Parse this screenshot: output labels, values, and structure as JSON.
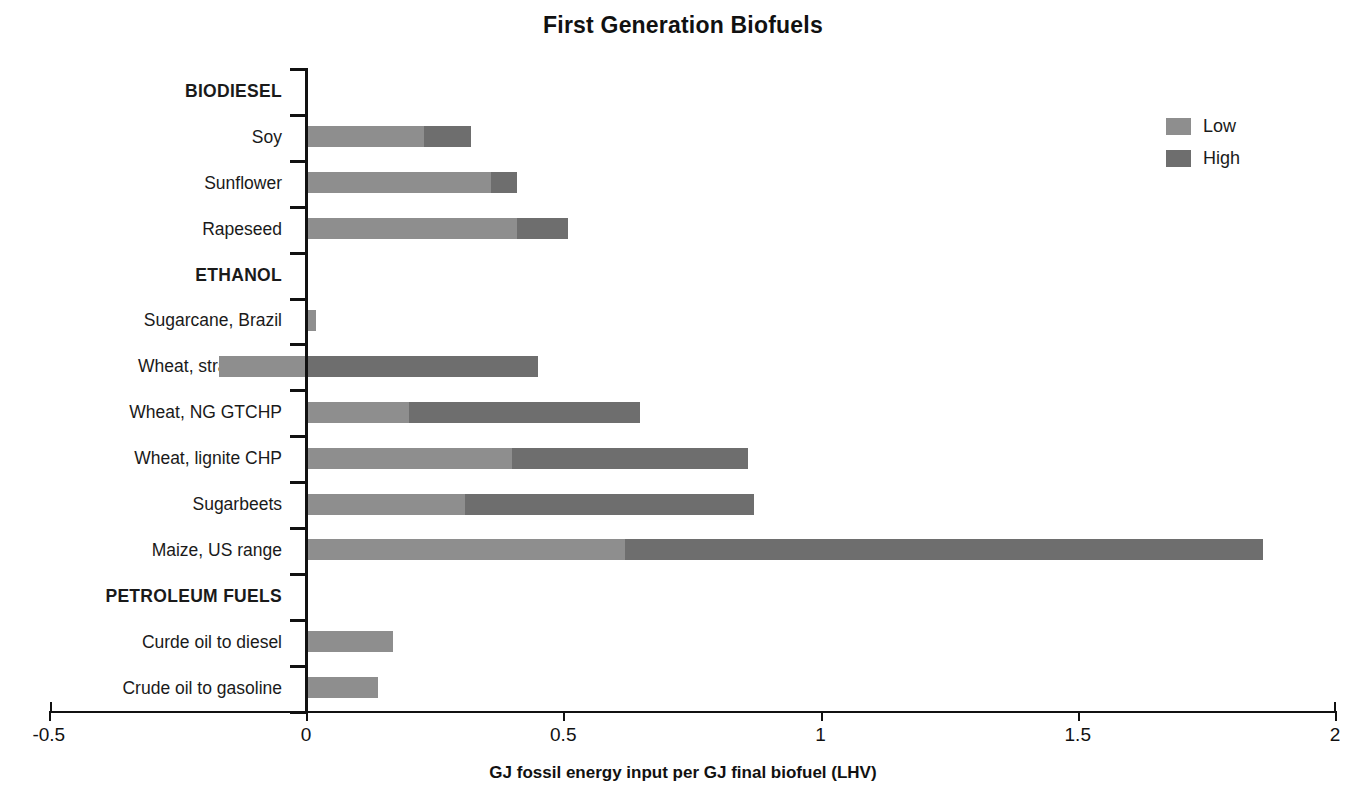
{
  "chart_data": {
    "type": "bar",
    "orientation": "horizontal",
    "stacked": true,
    "title": "First Generation Biofuels",
    "xlabel": "GJ fossil energy input per GJ final biofuel (LHV)",
    "ylabel": "",
    "xlim": [
      -0.5,
      2
    ],
    "xticks": [
      -0.5,
      0,
      0.5,
      1,
      1.5,
      2
    ],
    "xtick_labels": [
      "-0.5",
      "0",
      "0.5",
      "1",
      "1.5",
      "2"
    ],
    "grid": false,
    "legend_position": "top-right",
    "legend": [
      {
        "name": "Low",
        "color": "#8e8e8e"
      },
      {
        "name": "High",
        "color": "#6e6e6e"
      }
    ],
    "categories": [
      "BIODIESEL",
      "Soy",
      "Sunflower",
      "Rapeseed",
      "ETHANOL",
      "Sugarcane, Brazil",
      "Wheat, straw CHP",
      "Wheat, NG GTCHP",
      "Wheat, lignite CHP",
      "Sugarbeets",
      "Maize, US range",
      "PETROLEUM FUELS",
      "Curde oil to diesel",
      "Crude oil to gasoline"
    ],
    "group_headers": [
      "BIODIESEL",
      "ETHANOL",
      "PETROLEUM FUELS"
    ],
    "series": [
      {
        "name": "Low",
        "values": [
          null,
          0.23,
          0.36,
          0.41,
          null,
          0.02,
          -0.17,
          0.2,
          0.4,
          0.31,
          0.62,
          null,
          0.17,
          0.14
        ]
      },
      {
        "name": "High",
        "values": [
          null,
          0.32,
          0.41,
          0.51,
          null,
          0.02,
          0.45,
          0.65,
          0.86,
          0.87,
          1.86,
          null,
          0.17,
          0.14
        ]
      }
    ],
    "rows": [
      {
        "label": "BIODIESEL",
        "group": true
      },
      {
        "label": "Soy",
        "low_start": 0.0,
        "low_end": 0.23,
        "high_start": 0.23,
        "high_end": 0.32
      },
      {
        "label": "Sunflower",
        "low_start": 0.0,
        "low_end": 0.36,
        "high_start": 0.36,
        "high_end": 0.41
      },
      {
        "label": "Rapeseed",
        "low_start": 0.0,
        "low_end": 0.41,
        "high_start": 0.41,
        "high_end": 0.51
      },
      {
        "label": "ETHANOL",
        "group": true
      },
      {
        "label": "Sugarcane, Brazil",
        "low_start": 0.0,
        "low_end": 0.02,
        "high_start": 0.02,
        "high_end": 0.02
      },
      {
        "label": "Wheat, straw CHP",
        "low_start": -0.17,
        "low_end": 0.0,
        "high_start": 0.0,
        "high_end": 0.45
      },
      {
        "label": "Wheat, NG GTCHP",
        "low_start": 0.0,
        "low_end": 0.2,
        "high_start": 0.2,
        "high_end": 0.65
      },
      {
        "label": "Wheat, lignite CHP",
        "low_start": 0.0,
        "low_end": 0.4,
        "high_start": 0.4,
        "high_end": 0.86
      },
      {
        "label": "Sugarbeets",
        "low_start": 0.0,
        "low_end": 0.31,
        "high_start": 0.31,
        "high_end": 0.87
      },
      {
        "label": "Maize, US range",
        "low_start": 0.0,
        "low_end": 0.62,
        "high_start": 0.62,
        "high_end": 1.86
      },
      {
        "label": "PETROLEUM FUELS",
        "group": true
      },
      {
        "label": "Curde oil to diesel",
        "low_start": 0.0,
        "low_end": 0.17,
        "high_start": 0.17,
        "high_end": 0.17
      },
      {
        "label": "Crude oil to gasoline",
        "low_start": 0.0,
        "low_end": 0.14,
        "high_start": 0.14,
        "high_end": 0.14
      }
    ]
  }
}
